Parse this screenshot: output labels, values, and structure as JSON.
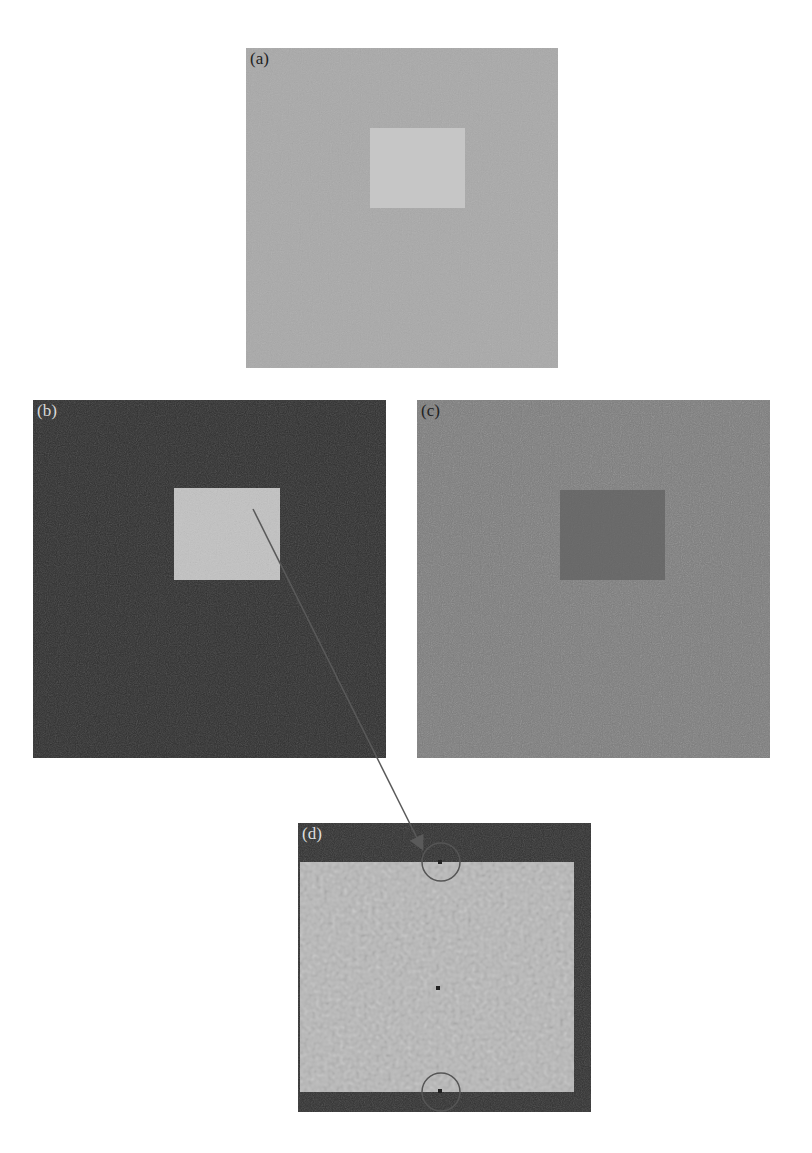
{
  "figure": {
    "panels": [
      {
        "id": "a",
        "label": "(a)",
        "bg": "#a9a9a9",
        "inner_color": "#c6c6c6",
        "label_color": "#222222"
      },
      {
        "id": "b",
        "label": "(b)",
        "bg": "#2e2e2e",
        "inner_color": "#c2c2c2",
        "label_color": "#d8d8d8"
      },
      {
        "id": "c",
        "label": "(c)",
        "bg": "#7c7c7c",
        "inner_color": "#5e5e5e",
        "label_color": "#222222"
      },
      {
        "id": "d",
        "label": "(d)",
        "bg": "#303030",
        "inner_color": "#b8b8b8",
        "label_color": "#dddddd"
      }
    ],
    "annotations": {
      "arrow": {
        "from_panel": "b",
        "to_panel": "d",
        "color": "#5a5a5a"
      },
      "circles": [
        {
          "panel": "d",
          "position": "top-edge",
          "color": "#555555"
        },
        {
          "panel": "d",
          "position": "bottom-edge",
          "color": "#555555"
        }
      ]
    }
  }
}
